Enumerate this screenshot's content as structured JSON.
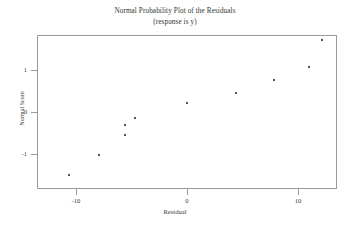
{
  "chart_data": {
    "type": "scatter",
    "title": "Normal Probability Plot of the Residuals",
    "subtitle": "(response is y)",
    "xlabel": "Residual",
    "ylabel": "Normal Score",
    "xlim": [
      -13.5,
      13.5
    ],
    "ylim": [
      -1.85,
      1.85
    ],
    "xticks": [
      -10,
      0,
      10
    ],
    "xtick_labels": [
      "-10",
      "0",
      "10"
    ],
    "yticks": [
      -1,
      0,
      1
    ],
    "ytick_labels": [
      "-1",
      "0",
      "1"
    ],
    "grid": false,
    "legend": "none",
    "marker": "dot",
    "marker_color": "#555555",
    "frame_color": "#9a9a9a",
    "n_points": 10,
    "x": [
      -10.7,
      -8.0,
      -5.7,
      -5.7,
      -4.8,
      -0.1,
      4.3,
      7.7,
      10.9,
      12.1
    ],
    "y": [
      -1.5,
      -1.0,
      -0.54,
      -0.28,
      -0.12,
      0.23,
      0.49,
      0.8,
      1.1,
      1.76
    ],
    "points": [
      {
        "x": -10.7,
        "y": -1.5
      },
      {
        "x": -8.0,
        "y": -1.0
      },
      {
        "x": -5.7,
        "y": -0.54
      },
      {
        "x": -5.7,
        "y": -0.28
      },
      {
        "x": -4.8,
        "y": -0.12
      },
      {
        "x": -0.1,
        "y": 0.23
      },
      {
        "x": 4.3,
        "y": 0.49
      },
      {
        "x": 7.7,
        "y": 0.8
      },
      {
        "x": 10.9,
        "y": 1.1
      },
      {
        "x": 12.1,
        "y": 1.76
      }
    ]
  },
  "titles": {
    "main": "Normal Probability Plot of the Residuals",
    "sub": "(response is y)"
  },
  "axes": {
    "x_label": "Residual",
    "y_label": "Normal Score",
    "x_ticks": [
      "-10",
      "0",
      "10"
    ],
    "y_ticks": [
      "1",
      "0",
      "-1"
    ]
  }
}
